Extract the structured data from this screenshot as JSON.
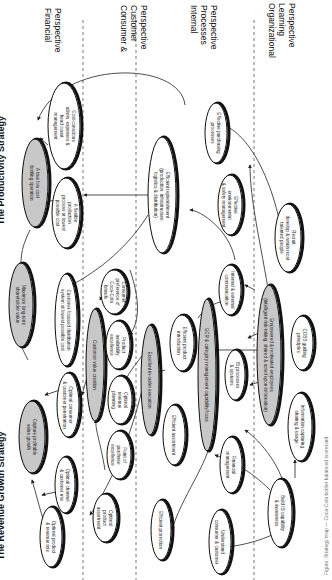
{
  "diagram": {
    "orientation": "rotated 90 degrees clockwise",
    "strategies": {
      "productivity": "The Productivity Strategy",
      "revenue_growth": "The Revenue Growth Strategy"
    },
    "perspectives": [
      {
        "id": "financial",
        "lines": [
          "Financial",
          "Perspective"
        ]
      },
      {
        "id": "consumer",
        "lines": [
          "Consumer &",
          "Customer",
          "Perspective"
        ]
      },
      {
        "id": "internal",
        "lines": [
          "Internal",
          "Processes",
          "Perspective"
        ]
      },
      {
        "id": "learning",
        "lines": [
          "Organizational",
          "Learning",
          "Perspective"
        ]
      }
    ],
    "nodes": {
      "low_cost_bottling": {
        "lines": [
          "A true low cost",
          "bottling operation"
        ],
        "shaded": true
      },
      "cost_conscious": {
        "lines": [
          "Cost-conscious",
          "admin, expenses &",
          "head count",
          "management"
        ],
        "shaded": false
      },
      "flexible_production": {
        "lines": [
          "A flexible",
          "production",
          "process at lowest",
          "possible cost"
        ],
        "shaded": false
      },
      "maximize_value": {
        "lines": [
          "Maximize long-term",
          "shareholder value"
        ],
        "shaded": true
      },
      "customer_focused_distribution": {
        "lines": [
          "Customer-focused distribution",
          "system at lowest possible cost"
        ],
        "shaded": false
      },
      "capture_profitable": {
        "lines": [
          "Capture profitable",
          "value growth"
        ],
        "shaded": true
      },
      "optimal_consumer_penetration": {
        "lines": [
          "Optimal consumer",
          "& customer penetration"
        ],
        "shaded": false
      },
      "optimal_channel_mix": {
        "lines": [
          "Optimal channel",
          "& customer mix"
        ],
        "shaded": false
      },
      "optimal_product_mix": {
        "lines": [
          "Optimal product",
          "& revenue mix"
        ],
        "shaded": false
      },
      "consumer_preference": {
        "lines": [
          "Consumer",
          "preference of",
          "Coca-Cola",
          "brands"
        ],
        "shaded": false
      },
      "customer_value_creation": {
        "lines": [
          "Customer value creation"
        ],
        "shaded": true
      },
      "product_availability": {
        "lines": [
          "Product",
          "availability",
          "excellence"
        ],
        "shaded": false
      },
      "optimal_revenue_planning": {
        "lines": [
          "Optimal",
          "revenue",
          "planning"
        ],
        "shaded": false
      },
      "point_of_purchase": {
        "lines": [
          "Point of",
          "purchase",
          "excellence"
        ],
        "shaded": false
      },
      "optimal_product_assortment": {
        "lines": [
          "Optimal",
          "product",
          "assortment"
        ],
        "shaded": false
      },
      "efficient_replenishment": {
        "lines": [
          "Efficient replenishment",
          "(production, infrastructure,",
          "logistics & distribution)"
        ],
        "shaded": false
      },
      "effective_purchasing": {
        "lines": [
          "Effective purchasing",
          "processes"
        ],
        "shaded": false
      },
      "environmental_safety": {
        "lines": [
          "Effective",
          "environmental",
          "& safety management"
        ],
        "shaded": false
      },
      "excellent_in_outlet": {
        "lines": [
          "Excellent in-outlet execution"
        ],
        "shaded": true
      },
      "efficient_product_intro": {
        "lines": [
          "Efficient product",
          "introduction"
        ],
        "shaded": false
      },
      "efficient_assortment": {
        "lines": [
          "Efficient assortment"
        ],
        "shaded": false
      },
      "efficient_promotion": {
        "lines": [
          "Efficient promotion"
        ],
        "shaded": false
      },
      "ecr_category": {
        "lines": [
          "ECR & category management capability/focus"
        ],
        "shaded": true
      },
      "internal_external_comm": {
        "lines": [
          "Internal & external",
          "communication"
        ],
        "shaded": false
      },
      "is_processes": {
        "lines": [
          "IS processes",
          "& systems"
        ],
        "shaded": false
      },
      "financial_management": {
        "lines": [
          "Financial",
          "management"
        ],
        "shaded": false
      },
      "understand_consumer": {
        "lines": [
          "Understand",
          "consumer & customer"
        ],
        "shaded": false
      },
      "recruit_develop": {
        "lines": [
          "Recruit,",
          "develop & retain most",
          "talented people"
        ],
        "shaded": false
      },
      "empowered_employees": {
        "lines": [
          "Empowered & motivated employees",
          "(intelligent risk-taking, shared & acted upon information)"
        ],
        "shaded": true
      },
      "cobs_guiding": {
        "lines": [
          "COBS guiding",
          "principles"
        ],
        "shaded": false
      },
      "information_capturing": {
        "lines": [
          "Information capturing,",
          "sharing & usage"
        ],
        "shaded": false
      },
      "build_is_capability": {
        "lines": [
          "Build IS capability",
          "& awareness"
        ],
        "shaded": false
      }
    },
    "caption": "Figure: Strategy map — Coca-Cola bottler balanced scorecard"
  }
}
